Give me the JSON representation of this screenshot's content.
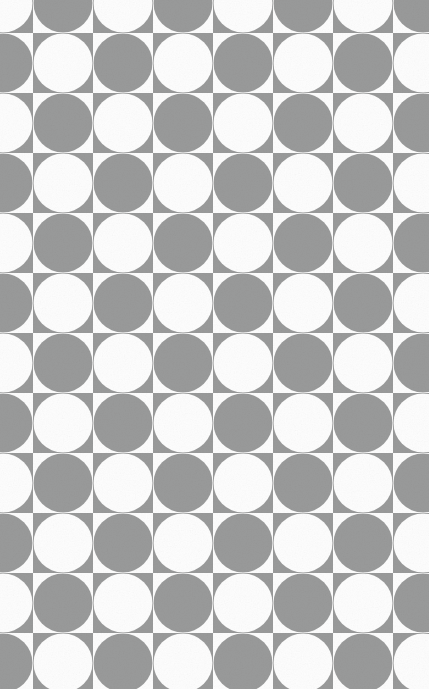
{
  "canvas": {
    "width": 429,
    "height": 689,
    "background_color": "#fdfdfd",
    "description": "Seamless two-tone checkerboard of inscribed circles, cropped on all four edges"
  },
  "pattern": {
    "name": "circle-checkerboard",
    "cell_pitch": 60,
    "circle_radius": 29.5,
    "origin_offset_x": -27,
    "origin_offset_y": -27,
    "columns_visible": 8,
    "rows_visible": 12,
    "tile_size": 120,
    "colors": {
      "gray": "#999a9a",
      "white": "#fdfdfd"
    },
    "rule": "Cells alternate in checkerboard fashion; each cell's circle is the inverse color of its own cell background, producing alternating concave corner wedges at every grid intersection."
  },
  "tile_cells": [
    {
      "col": 0,
      "row": 0,
      "cell_fill": "gray",
      "circle_fill": "white"
    },
    {
      "col": 1,
      "row": 0,
      "cell_fill": "white",
      "circle_fill": "gray"
    },
    {
      "col": 0,
      "row": 1,
      "cell_fill": "white",
      "circle_fill": "gray"
    },
    {
      "col": 1,
      "row": 1,
      "cell_fill": "gray",
      "circle_fill": "white"
    }
  ],
  "grain": {
    "enabled": true,
    "opacity": 0.55,
    "base_frequency": 0.82,
    "octaves": 3,
    "intensity": 0.14
  }
}
